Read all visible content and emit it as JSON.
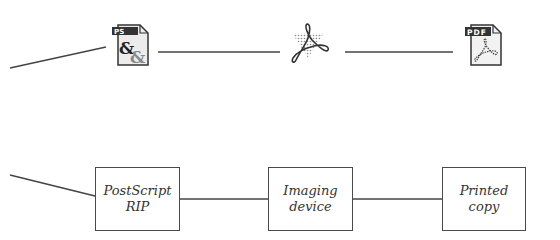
{
  "diagram": {
    "top_row": {
      "icons": [
        {
          "name": "postscript-file-icon",
          "label": "PS"
        },
        {
          "name": "acrobat-icon",
          "label": ""
        },
        {
          "name": "pdf-file-icon",
          "label": "PDF"
        }
      ]
    },
    "bottom_row": {
      "boxes": [
        {
          "line1": "PostScript",
          "line2": "RIP"
        },
        {
          "line1": "Imaging",
          "line2": "device"
        },
        {
          "line1": "Printed",
          "line2": "copy"
        }
      ]
    },
    "colors": {
      "line": "#444444",
      "icon_dark": "#333333",
      "icon_fill": "#e8e8e8"
    }
  }
}
